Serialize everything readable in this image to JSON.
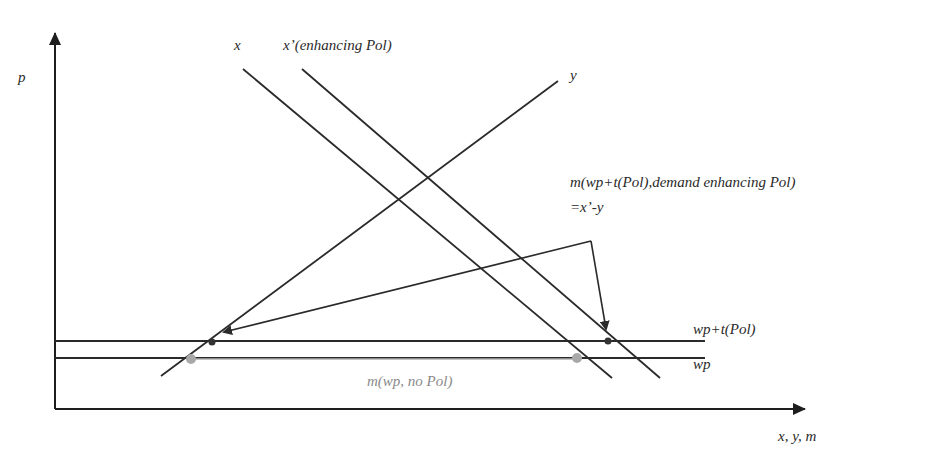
{
  "diagram": {
    "axes": {
      "y_label": "p",
      "x_label": "x, y, m"
    },
    "curves": {
      "x_label": "x",
      "x_prime_label": "x’(enhancing Pol)",
      "y_label": "y"
    },
    "price_levels": {
      "wp_plus_t_label": "wp+t(Pol)",
      "wp_label": "wp"
    },
    "annotations": {
      "m_enhancing_line1": "m(wp+t(Pol),demand enhancing Pol)",
      "m_enhancing_line2": "=x’-y",
      "m_no_pol": "m(wp, no Pol)"
    },
    "colors": {
      "line": "#2a2a2a",
      "gray_segment": "#b0b0b0",
      "gray_dot": "#a8a8a8",
      "dark_dot": "#333333"
    }
  }
}
